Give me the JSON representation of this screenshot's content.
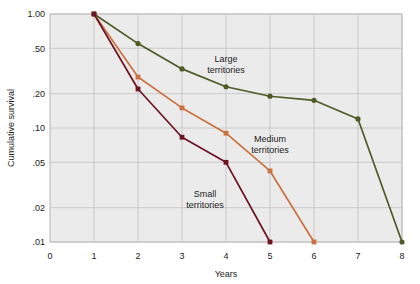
{
  "chart_data": {
    "type": "line",
    "title": "",
    "xlabel": "Years",
    "ylabel": "Cumulative survival",
    "xlim": [
      0,
      8
    ],
    "ylim": [
      0.01,
      1.0
    ],
    "yscale": "log",
    "grid": true,
    "legend_position": "inline-annotations",
    "xticks": [
      "0",
      "1",
      "2",
      "3",
      "4",
      "5",
      "6",
      "7",
      "8"
    ],
    "xtick_values": [
      0,
      1,
      2,
      3,
      4,
      5,
      6,
      7,
      8
    ],
    "yticks": [
      "1.00",
      ".50",
      ".20",
      ".10",
      ".05",
      ".02",
      ".01"
    ],
    "ytick_values": [
      1.0,
      0.5,
      0.2,
      0.1,
      0.05,
      0.02,
      0.01
    ],
    "series": [
      {
        "name": "Large territories",
        "color": "#4d5c27",
        "marker": "circle",
        "x": [
          1,
          2,
          3,
          4,
          5,
          6,
          7,
          8
        ],
        "values": [
          1.0,
          0.55,
          0.33,
          0.23,
          0.19,
          0.175,
          0.12,
          0.01
        ],
        "annotation": "Large\nterritories",
        "annotation_line1": "Large",
        "annotation_line2": "territories"
      },
      {
        "name": "Medium territories",
        "color": "#cb7240",
        "marker": "square",
        "x": [
          1,
          2,
          3,
          4,
          5,
          6
        ],
        "values": [
          1.0,
          0.28,
          0.15,
          0.09,
          0.042,
          0.01
        ],
        "annotation": "Medium\nterritories",
        "annotation_line1": "Medium",
        "annotation_line2": "territories"
      },
      {
        "name": "Small territories",
        "color": "#6d1420",
        "marker": "square",
        "x": [
          1,
          2,
          3,
          4,
          5
        ],
        "values": [
          1.0,
          0.22,
          0.083,
          0.05,
          0.01
        ],
        "annotation": "Small\nterritories",
        "annotation_line1": "Small",
        "annotation_line2": "territories"
      }
    ],
    "annotations": [
      {
        "label_line1": "Large",
        "label_line2": "territories",
        "x": 226,
        "y": 62
      },
      {
        "label_line1": "Medium",
        "label_line2": "territories",
        "x": 270,
        "y": 142
      },
      {
        "label_line1": "Small",
        "label_line2": "territories",
        "x": 205,
        "y": 197
      }
    ],
    "colors": {
      "large": "#4d5c27",
      "medium": "#cb7240",
      "small": "#6d1420",
      "plot_background": "#ebebeb",
      "grid": "#c9c9c9",
      "frame": "#b4b4b4",
      "text": "#1b1b1b"
    }
  }
}
